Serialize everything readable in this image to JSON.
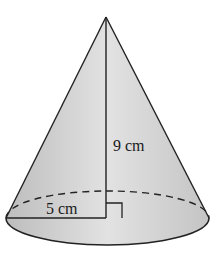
{
  "figure": {
    "type": "right circular cone",
    "labels": {
      "height": "9 cm",
      "radius": "5 cm"
    },
    "colors": {
      "fill_light": "#e6e6e6",
      "fill_dark": "#bdbdbd",
      "stroke": "#222222",
      "background": "#ffffff"
    }
  }
}
